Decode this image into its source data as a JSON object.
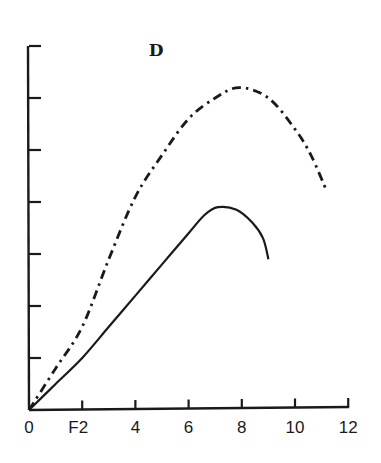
{
  "chart_data": {
    "type": "line",
    "title": "D",
    "xlabel": "",
    "ylabel": "",
    "xlim": [
      0,
      12
    ],
    "ylim": [
      0,
      7
    ],
    "grid": false,
    "legend": null,
    "x_ticks": [
      0,
      2,
      4,
      6,
      8,
      10,
      12
    ],
    "x_tick_labels": [
      "0",
      "F2",
      "4",
      "6",
      "8",
      "10",
      "12"
    ],
    "y_ticks": [
      1,
      2,
      3,
      4,
      5,
      6,
      7
    ],
    "y_tick_labels": [],
    "series": [
      {
        "name": "dash-dot curve",
        "style": "dash-dot",
        "x": [
          0,
          1,
          2,
          3,
          4,
          5,
          6,
          7,
          7.9,
          9,
          10,
          10.6,
          11.2
        ],
        "y": [
          0,
          0.8,
          1.6,
          2.9,
          4.1,
          4.9,
          5.6,
          6.0,
          6.2,
          6.0,
          5.4,
          4.9,
          4.2
        ]
      },
      {
        "name": "solid curve",
        "style": "solid",
        "x": [
          0,
          1,
          2,
          3,
          4,
          5,
          6,
          6.6,
          7.1,
          7.8,
          8.4,
          8.8,
          9.0
        ],
        "y": [
          0,
          0.5,
          1.0,
          1.6,
          2.2,
          2.8,
          3.4,
          3.75,
          3.9,
          3.85,
          3.6,
          3.3,
          2.9
        ]
      }
    ]
  }
}
